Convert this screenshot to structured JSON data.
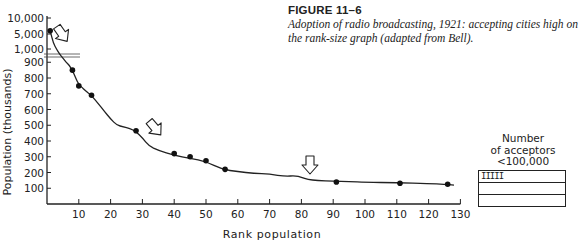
{
  "caption": {
    "figure_label": "FIGURE 11–6",
    "description": "Adoption of radio broadcasting, 1921: accepting cities high on the rank-size graph (adapted from Bell)."
  },
  "legend": {
    "title_lines": [
      "Number",
      "of acceptors",
      "<100,000"
    ],
    "rows": [
      "IIIII",
      "",
      ""
    ]
  },
  "chart_data": {
    "type": "line",
    "title": "Adoption of radio broadcasting, 1921: accepting cities high on the rank-size graph (adapted from Bell)",
    "xlabel": "Rank population",
    "ylabel": "Population (thousands)",
    "x_ticks": [
      10,
      20,
      30,
      40,
      50,
      60,
      70,
      80,
      90,
      100,
      110,
      120,
      130
    ],
    "y_ticks": [
      100,
      200,
      300,
      400,
      500,
      600,
      700,
      800,
      900,
      1000,
      5000,
      10000
    ],
    "y_tick_labels": [
      "100",
      "200",
      "300",
      "400",
      "500",
      "600",
      "700",
      "800",
      "900",
      "1,000",
      "5,000",
      "10,000"
    ],
    "xlim": [
      0,
      130
    ],
    "ylim": [
      0,
      10000
    ],
    "grid": false,
    "broken_axis": "y-axis break between 900 and 1,000 (compressed upper scale)",
    "curve": {
      "name": "Rank-size curve of cities",
      "x": [
        1,
        2,
        3,
        4,
        5,
        6,
        7,
        8,
        9,
        10,
        11,
        12,
        14,
        16,
        18,
        20,
        22,
        24,
        26,
        28,
        30,
        32,
        35,
        40,
        45,
        50,
        55,
        60,
        65,
        70,
        75,
        78,
        80,
        82,
        85,
        90,
        95,
        100,
        110,
        120,
        125,
        128
      ],
      "y": [
        6000,
        2500,
        1000,
        960,
        930,
        900,
        880,
        850,
        800,
        760,
        740,
        720,
        690,
        640,
        590,
        540,
        500,
        490,
        480,
        460,
        420,
        370,
        340,
        310,
        290,
        270,
        220,
        205,
        195,
        190,
        175,
        180,
        170,
        155,
        150,
        145,
        142,
        138,
        135,
        130,
        125,
        120
      ]
    },
    "accepting_cities": {
      "name": "Cities accepting radio broadcasting (dots)",
      "points": [
        {
          "rank": 1,
          "population": 6000
        },
        {
          "rank": 8,
          "population": 850
        },
        {
          "rank": 10,
          "population": 750
        },
        {
          "rank": 14,
          "population": 690
        },
        {
          "rank": 28,
          "population": 465
        },
        {
          "rank": 40,
          "population": 320
        },
        {
          "rank": 45,
          "population": 300
        },
        {
          "rank": 50,
          "population": 275
        },
        {
          "rank": 56,
          "population": 220
        },
        {
          "rank": 91,
          "population": 140
        },
        {
          "rank": 111,
          "population": 132
        },
        {
          "rank": 126,
          "population": 125
        }
      ]
    },
    "annotations": [
      {
        "type": "arrow",
        "near_rank": 7,
        "near_population": 3000
      },
      {
        "type": "arrow",
        "near_rank": 33,
        "near_population": 500
      },
      {
        "type": "arrow",
        "near_rank": 82,
        "near_population": 200
      }
    ],
    "inset_legend": {
      "title": "Number of acceptors <100,000",
      "tally": "IIIII",
      "count": 5
    }
  }
}
